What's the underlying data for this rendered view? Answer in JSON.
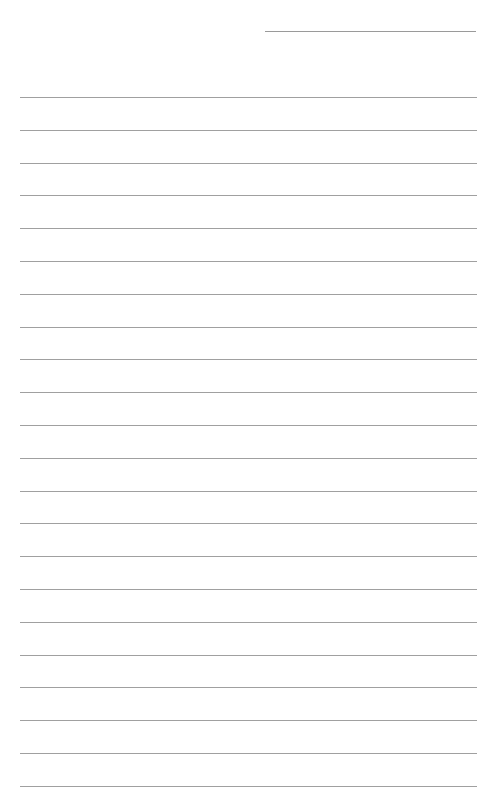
{
  "document": {
    "type": "lined-paper",
    "header_line": {
      "label": ""
    },
    "ruled_lines": {
      "count": 22,
      "first_y": 97,
      "spacing": 32.8,
      "color": "#a0a0a0"
    }
  }
}
